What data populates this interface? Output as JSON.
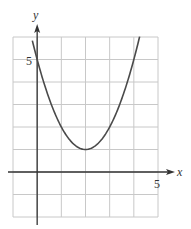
{
  "chart_data": {
    "type": "line",
    "title": "",
    "xlabel": "x",
    "ylabel": "y",
    "xlim": [
      -1,
      5
    ],
    "ylim": [
      -2,
      6
    ],
    "grid": true,
    "tick_labels": {
      "x": [
        "5"
      ],
      "y": [
        "5"
      ]
    },
    "series": [
      {
        "name": "parabola",
        "equation": "y = (x - 2)^2 + 1",
        "vertex": [
          2,
          1
        ],
        "y_intercept": 5,
        "x": [
          -0.2,
          0,
          0.5,
          1,
          1.5,
          2,
          2.5,
          3,
          3.5,
          4,
          4.24
        ],
        "y": [
          5.84,
          5,
          3.25,
          2,
          1.25,
          1,
          1.25,
          2,
          3.25,
          5,
          6.0
        ]
      }
    ],
    "legend": null
  },
  "colors": {
    "grid": "#c8c8c8",
    "axis": "#333333",
    "curve": "#4a4a4a"
  },
  "labels": {
    "x_axis": "x",
    "y_axis": "y",
    "x_tick_5": "5",
    "y_tick_5": "5"
  }
}
